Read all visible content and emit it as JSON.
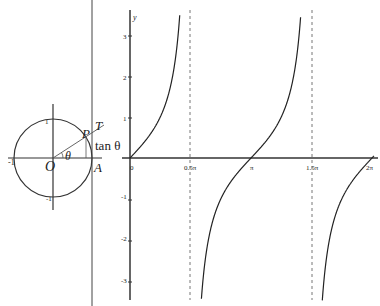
{
  "unit_circle": {
    "labels": {
      "origin": "O",
      "point_a": "A",
      "point_p": "P",
      "point_t": "T",
      "angle": "θ",
      "tan": "tan θ",
      "x_neg": "-1",
      "y_pos": "1",
      "y_neg": "-1"
    }
  },
  "graph": {
    "y_axis_label": "y",
    "x_ticks": [
      "0",
      "0.5π",
      "π",
      "1.5π",
      "2π"
    ],
    "y_ticks": {
      "p3": "3",
      "p2": "2",
      "p1": "1",
      "n1": "-1",
      "n2": "-2",
      "n3": "-3"
    },
    "colors": {
      "axis": "#333333",
      "curve": "#222222",
      "asymptote": "#555555"
    }
  },
  "chart_data": {
    "type": "line",
    "title": "",
    "function": "y = tan(x)",
    "xlabel": "",
    "ylabel": "y",
    "x_range": [
      0,
      6.283
    ],
    "ylim": [
      -3.4,
      3.4
    ],
    "x_tick_labels": [
      "0",
      "0.5π",
      "π",
      "1.5π",
      "2π"
    ],
    "y_tick_labels": [
      "-3",
      "-2",
      "-1",
      "1",
      "2",
      "3"
    ],
    "asymptotes": [
      "0.5π",
      "1.5π"
    ],
    "grid": false
  }
}
